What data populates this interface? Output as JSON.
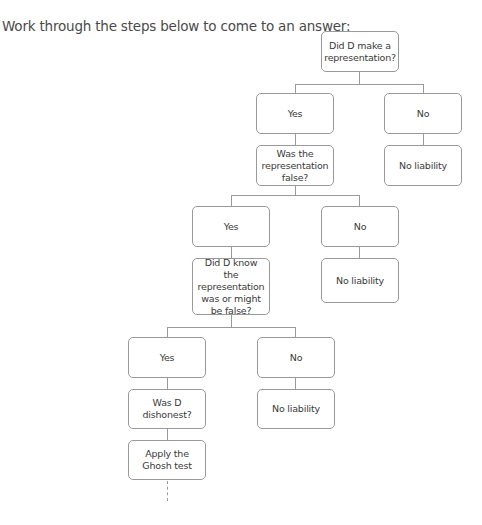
{
  "intro": "Work through the steps below to come to an answer:",
  "flowchart": {
    "q1": "Did D make a representation?",
    "q1_yes": "Yes",
    "q1_no": "No",
    "q1_no_result": "No liability",
    "q2": "Was the representation false?",
    "q2_yes": "Yes",
    "q2_no": "No",
    "q2_no_result": "No liability",
    "q3": "Did D know the representation was or might be false?",
    "q3_yes": "Yes",
    "q3_no": "No",
    "q3_no_result": "No liability",
    "q4": "Was D dishonest?",
    "q4_step": "Apply the Ghosh test"
  }
}
